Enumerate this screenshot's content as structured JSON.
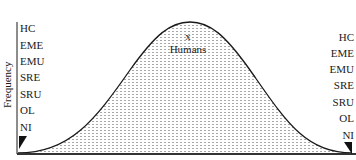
{
  "figure": {
    "y_axis_label": "Frequency",
    "peak_marker": "x",
    "peak_label": "Humans",
    "left_scale": [
      "HC",
      "EME",
      "EMU",
      "SRE",
      "SRU",
      "OL",
      "NI"
    ],
    "right_scale": [
      "HC",
      "EME",
      "EMU",
      "SRE",
      "SRU",
      "OL",
      "NI"
    ],
    "left_corner_marker": "black-triangle",
    "right_corner_marker": "black-triangle"
  },
  "colors": {
    "line": "#1a1a1a",
    "fill_pattern_dot": "#9a9a9a",
    "background": "#ffffff"
  }
}
